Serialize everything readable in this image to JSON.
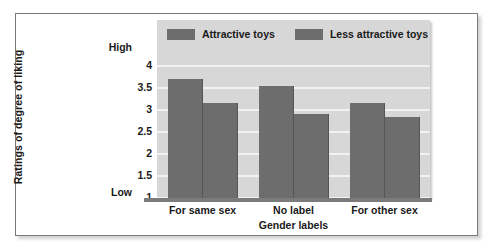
{
  "chart_data": {
    "type": "bar",
    "title": "",
    "subtitle": "",
    "categories": [
      "For same sex",
      "No label",
      "For other sex"
    ],
    "series": [
      {
        "name": "Attractive toys",
        "values": [
          3.7,
          3.55,
          3.16
        ],
        "color": "#6d6d6d"
      },
      {
        "name": "Less attractive toys",
        "values": [
          3.15,
          2.92,
          2.84
        ],
        "color": "#6d6d6d"
      }
    ],
    "xlabel": "Gender labels",
    "ylabel": "Ratings of degree of liking",
    "ylim": [
      1,
      4
    ],
    "yticks": [
      "4",
      "3.5",
      "3",
      "2.5",
      "2",
      "1.5",
      "1"
    ],
    "ytick_values": [
      4,
      3.5,
      3,
      2.5,
      2,
      1.5,
      1
    ],
    "scale_high_label": "High",
    "scale_low_label": "Low",
    "grid": true,
    "gridline_color": "#f2f2f2",
    "plot_background": "#d7d7d7",
    "legend_position": "top-inside"
  },
  "legend": {
    "items": [
      {
        "label": "Attractive toys"
      },
      {
        "label": "Less attractive toys"
      }
    ]
  },
  "axes": {
    "y_title": "Ratings of degree of liking",
    "x_title": "Gender labels",
    "high": "High",
    "low": "Low"
  }
}
